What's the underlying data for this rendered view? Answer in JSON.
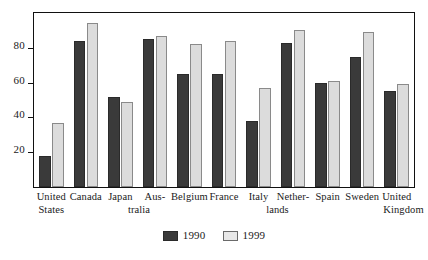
{
  "chart_data": {
    "type": "bar",
    "title": "",
    "subtitle": "",
    "xlabel": "",
    "ylabel": "",
    "ylim": [
      0,
      100
    ],
    "yticks": [
      20,
      40,
      60,
      80
    ],
    "ytick_labels": [
      "20",
      "40",
      "60",
      "80"
    ],
    "grid": false,
    "legend_position": "bottom-center",
    "frame": true,
    "categories": [
      "United States",
      "Canada",
      "Japan",
      "Australia",
      "Belgium",
      "France",
      "Italy",
      "Netherlands",
      "Spain",
      "Sweden",
      "United Kingdom"
    ],
    "category_label_lines": [
      [
        "United",
        "States"
      ],
      [
        "Canada",
        ""
      ],
      [
        "Japan",
        ""
      ],
      [
        "Aus-",
        "tralia"
      ],
      [
        "Belgium",
        ""
      ],
      [
        "France",
        ""
      ],
      [
        "Italy",
        ""
      ],
      [
        "Nether-",
        "lands"
      ],
      [
        "Spain",
        ""
      ],
      [
        "Sweden",
        ""
      ],
      [
        "United",
        "Kingdom"
      ]
    ],
    "series": [
      {
        "name": "1990",
        "color": "#3a3a3a",
        "values": [
          18,
          84,
          52,
          85,
          65,
          65,
          38,
          83,
          60,
          75,
          55
        ]
      },
      {
        "name": "1999",
        "color": "#dcdcdc",
        "values": [
          37,
          94,
          49,
          87,
          82,
          84,
          57,
          90,
          61,
          89,
          59
        ]
      }
    ]
  },
  "legend": {
    "entries": [
      {
        "label": "1990"
      },
      {
        "label": "1999"
      }
    ]
  },
  "colors": {
    "series_1990": "#3a3a3a",
    "series_1999": "#dcdcdc",
    "axis": "#111111",
    "background": "#ffffff"
  }
}
